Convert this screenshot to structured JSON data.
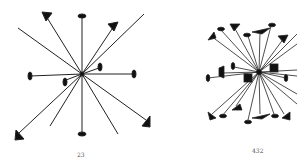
{
  "figures": [
    {
      "id": "left",
      "caption": "23",
      "center": [
        82,
        74
      ],
      "rays": [
        {
          "to": [
            82,
            16
          ],
          "end": "ellipse"
        },
        {
          "to": [
            82,
            134
          ],
          "end": "ellipse"
        },
        {
          "to": [
            30,
            76
          ],
          "end": "ellipse"
        },
        {
          "to": [
            134,
            74
          ],
          "end": "ellipse"
        },
        {
          "to": [
            44,
            14
          ],
          "end": "triangle"
        },
        {
          "to": [
            116,
            24
          ],
          "end": "triangle"
        },
        {
          "to": [
            18,
            28
          ],
          "end": "none"
        },
        {
          "to": [
            144,
            14
          ],
          "end": "none"
        },
        {
          "to": [
            16,
            136
          ],
          "end": "triangle"
        },
        {
          "to": [
            148,
            124
          ],
          "end": "triangle"
        },
        {
          "to": [
            50,
            126
          ],
          "end": "none"
        },
        {
          "to": [
            118,
            134
          ],
          "end": "none"
        },
        {
          "to": [
            100,
            66
          ],
          "end": "ellipse"
        },
        {
          "to": [
            65,
            82
          ],
          "end": "ellipse"
        }
      ]
    },
    {
      "id": "right",
      "caption": "432",
      "center": [
        259,
        72
      ]
    }
  ]
}
